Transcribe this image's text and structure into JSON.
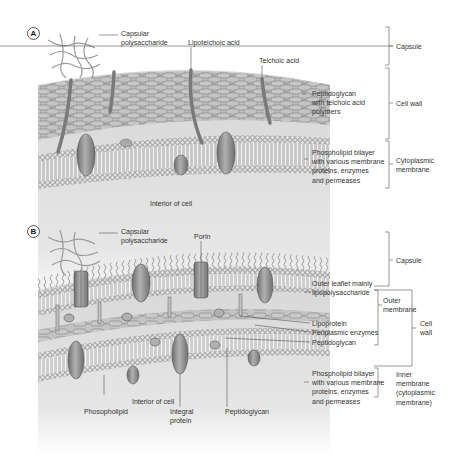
{
  "figure": {
    "panels": [
      {
        "id": "A",
        "badge": "A",
        "labels": {
          "capsular_polysaccharide": "Capsular\npolysaccharide",
          "lipoteichoic_acid": "Lipoteichoic acid",
          "teichoic_acid": "Teichoic acid",
          "peptidoglycan": "Peptidoglycan\nwith teichoic acid\npolymers",
          "phospholipid_bilayer": "Phospholipid bilayer\nwith various membrane\nproteins, enzymes\nand permeases",
          "interior": "Interior of cell"
        },
        "brackets": {
          "capsule": "Capsule",
          "cell_wall": "Cell wall",
          "cytoplasmic_membrane": "Cytoplasmic\nmembrane"
        }
      },
      {
        "id": "B",
        "badge": "B",
        "labels": {
          "capsular_polysaccharide": "Capsular\npolysaccharide",
          "porin": "Porin",
          "outer_leaflet": "Outer leaflet mainly\nlipopolysaccharide",
          "lipoprotein": "Lipoprotein",
          "periplasmic_enzymes": "Periplasmic enzymes",
          "peptidoglycan": "Peptidoglycan",
          "phospholipid_bilayer": "Phospholipid bilayer\nwith various membrane\nproteins, enzymes\nand permeases",
          "phospholipid": "Phosopholipid",
          "interior": "Interior of cell",
          "integral_protein": "Integral\nprotein",
          "peptidoglycan_bottom": "Peptidoglycan"
        },
        "brackets": {
          "capsule": "Capsule",
          "outer_membrane": "Outer\nmembrane",
          "cell_wall": "Cell\nwall",
          "inner_membrane": "Inner\nmembrane\n(cytoplasmic\nmembrane)"
        }
      }
    ],
    "colors": {
      "text": "#333333",
      "line": "#555555",
      "protein": "#8a8a8a",
      "lipid_head": "#b8b8b8",
      "peptidoglycan": "#c4c4c4",
      "background_gray": "#d9d9d9",
      "polysaccharide": "#9a9a9a"
    }
  }
}
